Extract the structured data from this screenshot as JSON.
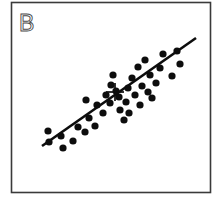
{
  "figure": {
    "panel_label": "B",
    "width": 223,
    "height": 203,
    "background_color": "#ffffff",
    "frame_color": "#3a3a3a",
    "point_color": "#0d0d0d",
    "line_color": "#0d0d0d",
    "label_color": "#4a4a4a"
  },
  "chart_data": {
    "type": "scatter",
    "title": "B",
    "subtitle": "",
    "xlabel": "",
    "ylabel": "",
    "xlim": [
      11,
      211
    ],
    "ylim": [
      2,
      193
    ],
    "grid": false,
    "legend": "none",
    "axis_ticks": "none",
    "relationship": "positive linear correlation",
    "n_points": 37,
    "point_radius": 3.6,
    "series": [
      {
        "name": "observations",
        "marker": "filled-circle",
        "color": "#0d0d0d",
        "points": [
          [
            48,
            131
          ],
          [
            49,
            142
          ],
          [
            61,
            136
          ],
          [
            63,
            148
          ],
          [
            73,
            141
          ],
          [
            78,
            127
          ],
          [
            85,
            132
          ],
          [
            89,
            118
          ],
          [
            95,
            126
          ],
          [
            97,
            105
          ],
          [
            86,
            100
          ],
          [
            103,
            113
          ],
          [
            106,
            95
          ],
          [
            110,
            103
          ],
          [
            111,
            85
          ],
          [
            113,
            75
          ],
          [
            116,
            91
          ],
          [
            119,
            97
          ],
          [
            120,
            110
          ],
          [
            124,
            120
          ],
          [
            126,
            102
          ],
          [
            128,
            88
          ],
          [
            129,
            113
          ],
          [
            132,
            78
          ],
          [
            135,
            95
          ],
          [
            138,
            67
          ],
          [
            140,
            105
          ],
          [
            142,
            86
          ],
          [
            145,
            60
          ],
          [
            148,
            92
          ],
          [
            150,
            75
          ],
          [
            152,
            98
          ],
          [
            156,
            83
          ],
          [
            160,
            68
          ],
          [
            163,
            54
          ],
          [
            172,
            76
          ],
          [
            177,
            51
          ],
          [
            180,
            64
          ]
        ]
      }
    ],
    "fit_line": {
      "name": "regression-line",
      "x0": 42,
      "y0": 146,
      "x1": 196,
      "y1": 38,
      "stroke_width": 2.6,
      "color": "#0d0d0d"
    },
    "centroid_marker": {
      "name": "centroid-cross",
      "x": 115,
      "y": 92,
      "arm_length": 9,
      "color": "#0d0d0d"
    }
  }
}
